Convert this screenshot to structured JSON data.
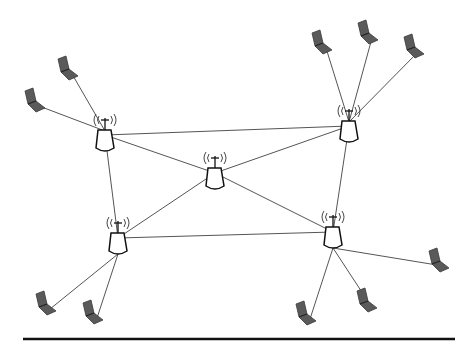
{
  "diagram": {
    "type": "wireless-mesh-network",
    "colors": {
      "link": "#555555",
      "laptop_fill": "#5a5a5a",
      "laptop_stroke": "#3a3a3a",
      "ap_stroke": "#111111",
      "baseline": "#111111",
      "background": "#ffffff"
    },
    "access_points": [
      {
        "id": "ap-top-left",
        "x": 105,
        "y": 141
      },
      {
        "id": "ap-top-right",
        "x": 349,
        "y": 132
      },
      {
        "id": "ap-center",
        "x": 215,
        "y": 179
      },
      {
        "id": "ap-bottom-left",
        "x": 118,
        "y": 244
      },
      {
        "id": "ap-bottom-right",
        "x": 333,
        "y": 238
      }
    ],
    "laptops": [
      {
        "id": "laptop-1",
        "x": 68,
        "y": 68,
        "ap": "ap-top-left"
      },
      {
        "id": "laptop-2",
        "x": 35,
        "y": 100,
        "ap": "ap-top-left"
      },
      {
        "id": "laptop-3",
        "x": 322,
        "y": 42,
        "ap": "ap-top-right"
      },
      {
        "id": "laptop-4",
        "x": 368,
        "y": 32,
        "ap": "ap-top-right"
      },
      {
        "id": "laptop-5",
        "x": 414,
        "y": 46,
        "ap": "ap-top-right"
      },
      {
        "id": "laptop-6",
        "x": 46,
        "y": 303,
        "ap": "ap-bottom-left"
      },
      {
        "id": "laptop-7",
        "x": 93,
        "y": 312,
        "ap": "ap-bottom-left"
      },
      {
        "id": "laptop-8",
        "x": 306,
        "y": 313,
        "ap": "ap-bottom-right"
      },
      {
        "id": "laptop-9",
        "x": 367,
        "y": 300,
        "ap": "ap-bottom-right"
      },
      {
        "id": "laptop-10",
        "x": 439,
        "y": 260,
        "ap": "ap-bottom-right"
      }
    ],
    "backbone_links": [
      [
        "ap-top-left",
        "ap-top-right"
      ],
      [
        "ap-top-left",
        "ap-center"
      ],
      [
        "ap-top-left",
        "ap-bottom-left"
      ],
      [
        "ap-top-right",
        "ap-center"
      ],
      [
        "ap-top-right",
        "ap-bottom-right"
      ],
      [
        "ap-center",
        "ap-bottom-left"
      ],
      [
        "ap-center",
        "ap-bottom-right"
      ],
      [
        "ap-bottom-left",
        "ap-bottom-right"
      ]
    ],
    "baseline": {
      "x1": 23,
      "x2": 455,
      "y": 339
    }
  }
}
